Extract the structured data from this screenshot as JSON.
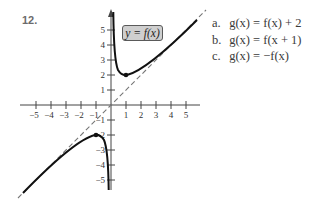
{
  "problem": {
    "number": "12.",
    "function_label": "y = f(x)",
    "parts": [
      {
        "label": "a.",
        "text": "g(x) = f(x) + 2"
      },
      {
        "label": "b.",
        "text": "g(x) = f(x + 1)"
      },
      {
        "label": "c.",
        "text": "g(x) = −f(x)"
      }
    ]
  },
  "graph": {
    "x_ticks": [
      "-5",
      "-4",
      "-3",
      "-2",
      "-1",
      "1",
      "2",
      "3",
      "4",
      "5"
    ],
    "y_ticks_positive": [
      "1",
      "2",
      "3",
      "4",
      "5"
    ],
    "y_ticks_negative": [
      "-1",
      "-2",
      "-3",
      "-4",
      "-5"
    ],
    "asymptote": "y = x (dashed)",
    "marked_points": [
      [
        1,
        2
      ],
      [
        -1,
        -2
      ]
    ],
    "colors": {
      "curve": "#111111",
      "axis": "#444444",
      "dashed": "#777777",
      "label_box": "#cfcfcf"
    }
  }
}
